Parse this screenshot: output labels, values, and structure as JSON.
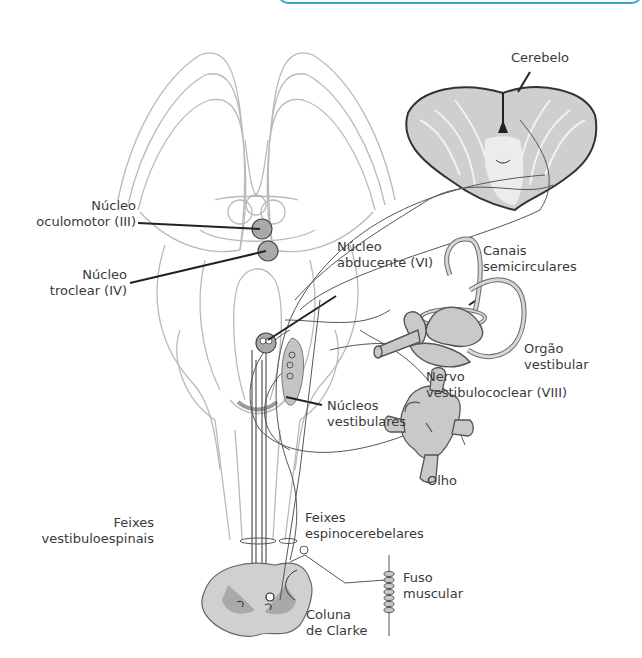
{
  "diagram": {
    "accent_color": "#3aa9c9",
    "labels": {
      "cerebelo": [
        "Cerebelo"
      ],
      "oculomotor": [
        "Núcleo",
        "oculomotor (III)"
      ],
      "troclear": [
        "Núcleo",
        "troclear (IV)"
      ],
      "abducente": [
        "Núcleo",
        "abducente (VI)"
      ],
      "canais": [
        "Canais",
        "semicirculares"
      ],
      "orgao": [
        "Orgão",
        "vestibular"
      ],
      "nervo": [
        "Nervo",
        "vestibulococlear (VIII)"
      ],
      "nucleos_vest": [
        "Núcleos",
        "vestibulares"
      ],
      "olho": [
        "Olho"
      ],
      "feixes_vest": [
        "Feixes",
        "vestibuloespinais"
      ],
      "feixes_espino": [
        "Feixes",
        "espinocerebelares"
      ],
      "fuso": [
        "Fuso",
        "muscular"
      ],
      "clarke": [
        "Coluna",
        "de Clarke"
      ]
    }
  }
}
